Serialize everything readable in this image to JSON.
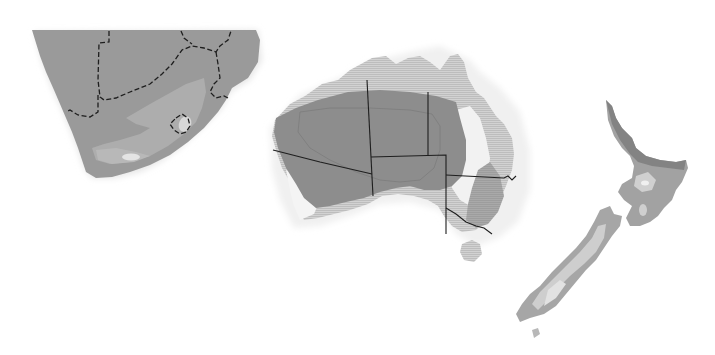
{
  "figure": {
    "regions": [
      {
        "name": "Southern Africa",
        "border_style": "dashed"
      },
      {
        "name": "Australia",
        "border_style": "solid"
      },
      {
        "name": "New Zealand",
        "border_style": "none"
      }
    ]
  },
  "colors": {
    "background": "#ffffff",
    "zone_dark": "#8e8e8e",
    "zone_mid": "#a6a6a6",
    "zone_light": "#c4c4c4",
    "zone_pale": "#dcdcdc",
    "zone_white": "#efefef",
    "border_line": "#1e1e1e"
  }
}
